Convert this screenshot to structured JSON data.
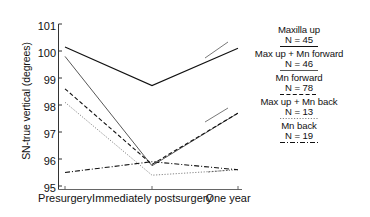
{
  "chart_data": {
    "type": "line",
    "title": "",
    "xlabel": "",
    "ylabel": "SN-true vertical (degrees)",
    "categories": [
      "Presurgery",
      "Immediately postsurgery",
      "One year"
    ],
    "x": [
      0,
      1,
      2
    ],
    "ylim": [
      95,
      101
    ],
    "yticks": [
      101,
      100,
      99,
      98,
      97,
      96,
      95
    ],
    "ytick_labels": [
      "101",
      "100",
      "99",
      "98",
      "97",
      "96",
      "95"
    ],
    "grid": false,
    "legend_position": "right",
    "series": [
      {
        "name": "Maxilla up",
        "n_label": "N = 45",
        "n": 45,
        "style": "solid",
        "color": "#111111",
        "width": 1.1,
        "values": [
          100.15,
          98.72,
          100.1
        ]
      },
      {
        "name": "Max up + Mn forward",
        "n_label": "N = 46",
        "n": 46,
        "style": "solid-thin",
        "color": "#444444",
        "width": 0.9,
        "values": [
          99.8,
          95.75,
          97.7
        ]
      },
      {
        "name": "Mn forward",
        "n_label": "N = 78",
        "n": 78,
        "style": "dashed",
        "color": "#111111",
        "width": 1.1,
        "values": [
          98.6,
          95.8,
          97.7
        ]
      },
      {
        "name": "Max up + Mn back",
        "n_label": "N = 13",
        "n": 13,
        "style": "dotted",
        "color": "#777777",
        "width": 0.9,
        "values": [
          98.1,
          95.4,
          95.6
        ]
      },
      {
        "name": "Mn back",
        "n_label": "N = 19",
        "n": 19,
        "style": "dash-dot",
        "color": "#111111",
        "width": 1.1,
        "values": [
          95.5,
          95.9,
          95.6
        ]
      }
    ]
  },
  "axes": {
    "y_title": "SN-true vertical (degrees)",
    "y_tick_0": "101",
    "y_tick_1": "100",
    "y_tick_2": "99",
    "y_tick_3": "98",
    "y_tick_4": "97",
    "y_tick_5": "96",
    "y_tick_6": "95",
    "x_tick_0": "Presurgery",
    "x_tick_1": "Immediately postsurgery",
    "x_tick_2": "One year"
  },
  "legend": {
    "entries": [
      {
        "label": "Maxilla up",
        "n_text": "N = 45"
      },
      {
        "label": "Max up + Mn forward",
        "n_text": "N = 46"
      },
      {
        "label": "Mn forward",
        "n_text": "N = 78"
      },
      {
        "label": "Max up + Mn back",
        "n_text": "N = 13"
      },
      {
        "label": "Mn back",
        "n_text": "N = 19"
      }
    ]
  },
  "colors": {
    "ink": "#111111",
    "mid": "#444444",
    "light": "#777777",
    "background": "#ffffff"
  }
}
